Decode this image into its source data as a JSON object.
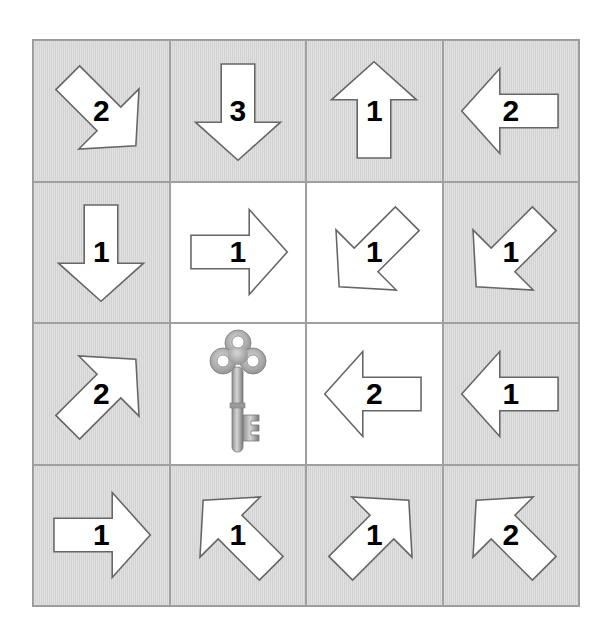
{
  "puzzle": {
    "rows": 4,
    "cols": 4,
    "colors": {
      "gray_cell": "#d9d9d9",
      "white_cell": "#ffffff",
      "grid_line": "#a0a0a0",
      "arrow_fill": "#ffffff",
      "arrow_stroke": "#666666",
      "number": "#000000"
    },
    "cells": [
      {
        "row": 0,
        "col": 0,
        "type": "arrow",
        "direction": "down-right",
        "number": "2",
        "shade": "gray"
      },
      {
        "row": 0,
        "col": 1,
        "type": "arrow",
        "direction": "down",
        "number": "3",
        "shade": "gray"
      },
      {
        "row": 0,
        "col": 2,
        "type": "arrow",
        "direction": "up",
        "number": "1",
        "shade": "gray"
      },
      {
        "row": 0,
        "col": 3,
        "type": "arrow",
        "direction": "left",
        "number": "2",
        "shade": "gray"
      },
      {
        "row": 1,
        "col": 0,
        "type": "arrow",
        "direction": "down",
        "number": "1",
        "shade": "gray"
      },
      {
        "row": 1,
        "col": 1,
        "type": "arrow",
        "direction": "right",
        "number": "1",
        "shade": "white"
      },
      {
        "row": 1,
        "col": 2,
        "type": "arrow",
        "direction": "down-left",
        "number": "1",
        "shade": "white"
      },
      {
        "row": 1,
        "col": 3,
        "type": "arrow",
        "direction": "down-left",
        "number": "1",
        "shade": "gray"
      },
      {
        "row": 2,
        "col": 0,
        "type": "arrow",
        "direction": "up-right",
        "number": "2",
        "shade": "gray"
      },
      {
        "row": 2,
        "col": 1,
        "type": "key",
        "icon": "key-icon",
        "shade": "white"
      },
      {
        "row": 2,
        "col": 2,
        "type": "arrow",
        "direction": "left",
        "number": "2",
        "shade": "white"
      },
      {
        "row": 2,
        "col": 3,
        "type": "arrow",
        "direction": "left",
        "number": "1",
        "shade": "gray"
      },
      {
        "row": 3,
        "col": 0,
        "type": "arrow",
        "direction": "right",
        "number": "1",
        "shade": "gray"
      },
      {
        "row": 3,
        "col": 1,
        "type": "arrow",
        "direction": "up-left",
        "number": "1",
        "shade": "gray"
      },
      {
        "row": 3,
        "col": 2,
        "type": "arrow",
        "direction": "up-right",
        "number": "1",
        "shade": "gray"
      },
      {
        "row": 3,
        "col": 3,
        "type": "arrow",
        "direction": "up-left",
        "number": "2",
        "shade": "gray"
      }
    ]
  }
}
